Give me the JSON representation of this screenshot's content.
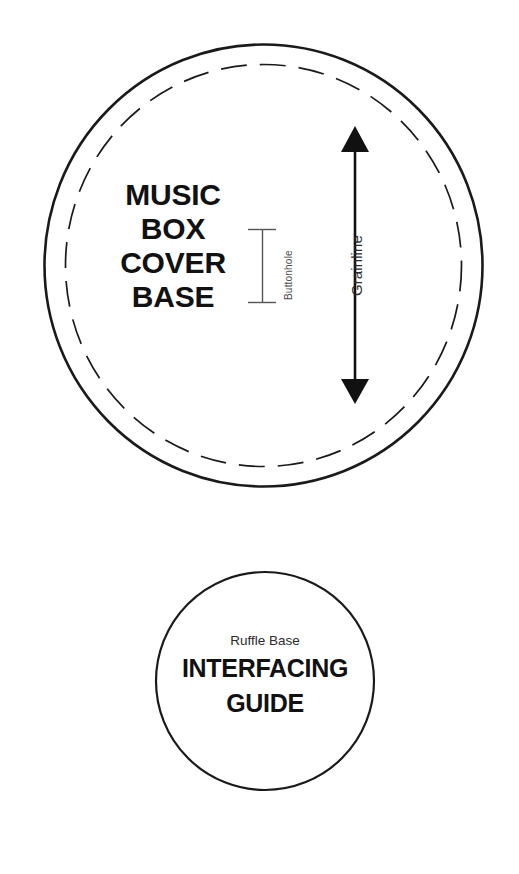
{
  "sheet": {
    "background_color": "#ffffff",
    "ink_color": "#1a1a1a"
  },
  "main_piece": {
    "name": "music-box-cover-base",
    "title_lines": [
      "MUSIC",
      "BOX",
      "COVER",
      "BASE"
    ],
    "cut_line": {
      "shape": "ellipse",
      "style": "solid",
      "center_x": 263.5,
      "center_y": 265.5,
      "radius_x": 219,
      "radius_y": 221,
      "stroke_color": "#1a1a1a",
      "stroke_width": 2.6
    },
    "stitch_line": {
      "shape": "ellipse",
      "style": "dashed",
      "center_x": 263.5,
      "center_y": 265.5,
      "radius_x": 198,
      "radius_y": 201,
      "stroke_color": "#1a1a1a",
      "stroke_width": 1.7,
      "dash_pattern": "26 13"
    },
    "buttonhole": {
      "label": "Buttonhole",
      "marker_style": "i-beam",
      "x": 262,
      "y_top": 229,
      "y_bottom": 303,
      "cap_half_width": 14,
      "stroke_color": "#555555",
      "stroke_width": 1.4
    },
    "grainline": {
      "label": "Grainline",
      "marker_style": "double-headed-arrow",
      "x": 355,
      "y_top": 126,
      "y_bottom": 404,
      "arrow_half_width": 14,
      "arrow_head_length": 25,
      "stroke_color": "#111111",
      "stroke_width": 2.6
    }
  },
  "interfacing_piece": {
    "name": "interfacing-guide",
    "subtitle": "Ruffle Base",
    "title_lines": [
      "INTERFACING",
      "GUIDE"
    ],
    "cut_line": {
      "shape": "circle",
      "style": "solid",
      "center_x": 265,
      "center_y": 681,
      "radius": 109,
      "stroke_color": "#1a1a1a",
      "stroke_width": 2.2
    }
  }
}
